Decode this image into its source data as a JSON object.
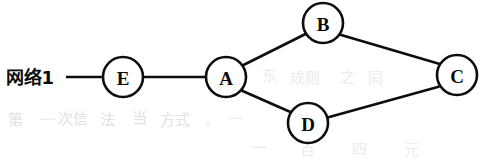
{
  "figure": {
    "kind": "network-topology-diagram",
    "background_color": "#ffffff",
    "ink_color": "#0d0d0d",
    "width": 481,
    "height": 162
  },
  "labels": {
    "network_label": "网络1"
  },
  "nodes": [
    {
      "id": "E",
      "label": "E",
      "cx": 123,
      "cy": 77,
      "r": 20
    },
    {
      "id": "A",
      "label": "A",
      "cx": 226,
      "cy": 77,
      "r": 20
    },
    {
      "id": "B",
      "label": "B",
      "cx": 323,
      "cy": 23,
      "r": 20
    },
    {
      "id": "C",
      "label": "C",
      "cx": 457,
      "cy": 75,
      "r": 20
    },
    {
      "id": "D",
      "label": "D",
      "cx": 308,
      "cy": 123,
      "r": 20
    }
  ],
  "edges": [
    {
      "id": "net1-E",
      "from": "网络1",
      "to": "E",
      "x1": 66,
      "y1": 77,
      "x2": 103,
      "y2": 77
    },
    {
      "id": "E-A",
      "from": "E",
      "to": "A",
      "x1": 143,
      "y1": 77,
      "x2": 206,
      "y2": 77
    },
    {
      "id": "A-B",
      "from": "A",
      "to": "B",
      "x1": 242.5,
      "y1": 65.5,
      "x2": 306.5,
      "y2": 33.5
    },
    {
      "id": "A-D",
      "from": "A",
      "to": "D",
      "x1": 241.5,
      "y1": 90.5,
      "x2": 291.5,
      "y2": 112.5
    },
    {
      "id": "B-C",
      "from": "B",
      "to": "C",
      "x1": 339.5,
      "y1": 34.5,
      "x2": 441.5,
      "y2": 64.5
    },
    {
      "id": "D-C",
      "from": "D",
      "to": "C",
      "x1": 327.5,
      "y1": 117.5,
      "x2": 439.5,
      "y2": 86.5
    }
  ],
  "artifacts": {
    "note": "faint scanner bleed-through marks from reverse page",
    "marks": [
      {
        "x": 8,
        "y": 120,
        "text": "第",
        "faint": false
      },
      {
        "x": 40,
        "y": 120,
        "text": "一",
        "faint": true
      },
      {
        "x": 58,
        "y": 119,
        "text": "次信",
        "faint": false
      },
      {
        "x": 100,
        "y": 120,
        "text": "法",
        "faint": false
      },
      {
        "x": 132,
        "y": 118,
        "text": "当",
        "faint": false
      },
      {
        "x": 160,
        "y": 120,
        "text": "方式",
        "faint": false
      },
      {
        "x": 205,
        "y": 120,
        "text": "。",
        "faint": true
      },
      {
        "x": 228,
        "y": 119,
        "text": "一",
        "faint": true
      },
      {
        "x": 262,
        "y": 76,
        "text": "东",
        "faint": true
      },
      {
        "x": 290,
        "y": 78,
        "text": "成则",
        "faint": true
      },
      {
        "x": 340,
        "y": 77,
        "text": "之",
        "faint": true
      },
      {
        "x": 368,
        "y": 78,
        "text": "同",
        "faint": true
      },
      {
        "x": 252,
        "y": 148,
        "text": "一",
        "faint": true
      },
      {
        "x": 300,
        "y": 150,
        "text": "百",
        "faint": true
      },
      {
        "x": 352,
        "y": 149,
        "text": "四",
        "faint": true
      },
      {
        "x": 404,
        "y": 150,
        "text": "元",
        "faint": true
      }
    ]
  }
}
